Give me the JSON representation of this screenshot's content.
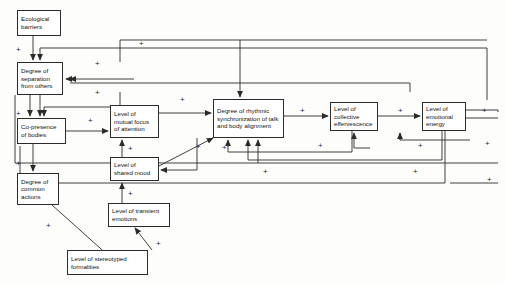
{
  "diagram": {
    "type": "causal-loop-diagram",
    "line_color": "#2b2b2b",
    "background": "#fdfdfc",
    "sign_label": "+",
    "nodes": [
      {
        "id": "ecological-barriers",
        "label": "Ecological barriers",
        "x": 17,
        "y": 10,
        "w": 44,
        "h": 26
      },
      {
        "id": "degree-separation",
        "label": "Degree of separation from others",
        "x": 17,
        "y": 62,
        "w": 46,
        "h": 33
      },
      {
        "id": "co-presence-bodies",
        "label": "Co-presence of bodies",
        "x": 17,
        "y": 118,
        "w": 49,
        "h": 26
      },
      {
        "id": "degree-common-actions",
        "label": "Degree of common actions",
        "x": 17,
        "y": 173,
        "w": 42,
        "h": 32
      },
      {
        "id": "mutual-focus",
        "label": "Level of mutual focus of attention",
        "x": 110,
        "y": 105,
        "w": 49,
        "h": 33
      },
      {
        "id": "shared-mood",
        "label": "Level of shared mood",
        "x": 110,
        "y": 157,
        "w": 49,
        "h": 24
      },
      {
        "id": "transient-emotions",
        "label": "Level of transient emotions",
        "x": 108,
        "y": 203,
        "w": 62,
        "h": 24
      },
      {
        "id": "stereotyped-formalities",
        "label": "Level of stereotyped formalities",
        "x": 67,
        "y": 250,
        "w": 81,
        "h": 25
      },
      {
        "id": "rhythmic-sync",
        "label": "Degree of rhythmic synchronization of talk and body alignment",
        "x": 213,
        "y": 99,
        "w": 71,
        "h": 39
      },
      {
        "id": "collective-effervescence",
        "label": "Level of collective effervescence",
        "x": 330,
        "y": 102,
        "w": 48,
        "h": 29
      },
      {
        "id": "emotional-energy",
        "label": "Level of emotional energy",
        "x": 422,
        "y": 102,
        "w": 44,
        "h": 29
      }
    ],
    "signs": [
      {
        "id": "sign-eco-to-sep",
        "x": 16,
        "y": 46
      },
      {
        "id": "sign-sep-to-copres",
        "x": 16,
        "y": 110
      },
      {
        "id": "sign-copres-to-actions",
        "x": 16,
        "y": 160
      },
      {
        "id": "sign-actions-to-stereo",
        "x": 46,
        "y": 222
      },
      {
        "id": "sign-stereo-to-trans",
        "x": 156,
        "y": 240
      },
      {
        "id": "sign-trans-to-mood",
        "x": 128,
        "y": 190
      },
      {
        "id": "sign-mood-to-focus",
        "x": 128,
        "y": 145
      },
      {
        "id": "sign-copres-to-focus",
        "x": 88,
        "y": 117
      },
      {
        "id": "sign-focus-to-sync",
        "x": 180,
        "y": 96
      },
      {
        "id": "sign-mood-to-sync",
        "x": 196,
        "y": 143
      },
      {
        "id": "sign-sync-to-eff",
        "x": 300,
        "y": 107
      },
      {
        "id": "sign-eff-to-energy",
        "x": 398,
        "y": 107
      },
      {
        "id": "sign-energy-out",
        "x": 482,
        "y": 107
      },
      {
        "id": "sign-top-feedback",
        "x": 139,
        "y": 40
      },
      {
        "id": "sign-sep-feedback",
        "x": 95,
        "y": 60
      },
      {
        "id": "sign-sep-feedback2",
        "x": 95,
        "y": 89
      },
      {
        "id": "sign-eff-return",
        "x": 318,
        "y": 142
      },
      {
        "id": "sign-energy-return",
        "x": 418,
        "y": 142
      },
      {
        "id": "sign-sync-return-low",
        "x": 222,
        "y": 144
      },
      {
        "id": "sign-long-feedback",
        "x": 263,
        "y": 168
      },
      {
        "id": "sign-long-feedback2",
        "x": 413,
        "y": 168
      },
      {
        "id": "sign-mid-right",
        "x": 485,
        "y": 140
      },
      {
        "id": "sign-bottom-right",
        "x": 487,
        "y": 176
      }
    ]
  }
}
